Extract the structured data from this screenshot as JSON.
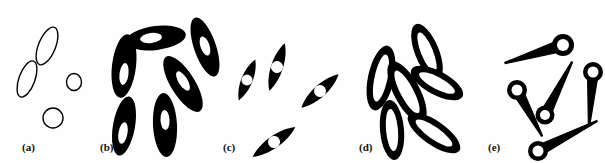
{
  "figure": {
    "title": "",
    "width": 605,
    "height": 163,
    "background_color": "#fefefe",
    "ink_color": "#000000",
    "hole_color": "#ffffff",
    "outline_stroke_width": 1.4
  },
  "panels": [
    {
      "id": "a",
      "label": "(a)",
      "label_x": 22,
      "label_y": 141,
      "style": "outline-ellipses",
      "description": "isolated thin-outlined ellipses, no fill"
    },
    {
      "id": "b",
      "label": "(b)",
      "label_x": 100,
      "label_y": 141,
      "style": "solid-ellipses-with-nucleus",
      "description": "solid black ellipses with small white inner ellipse, touching in chains"
    },
    {
      "id": "c",
      "label": "(c)",
      "label_x": 223,
      "label_y": 141,
      "style": "spindles-with-round-hole",
      "description": "elongated spindle blobs with white circular hole"
    },
    {
      "id": "d",
      "label": "(d)",
      "label_x": 359,
      "label_y": 141,
      "style": "thick-elliptical-rings",
      "description": "thick black elliptical annuli clustered and overlapping"
    },
    {
      "id": "e",
      "label": "(e)",
      "label_x": 488,
      "label_y": 141,
      "style": "tadpole-ring-head-with-tail",
      "description": "ring-headed tadpole shapes with tapering tails"
    }
  ],
  "shapes": {
    "a": [
      {
        "name": "outline-ellipse-1",
        "cx": 47,
        "cy": 46,
        "rx": 8.5,
        "ry": 20,
        "rot": 22
      },
      {
        "name": "outline-ellipse-2",
        "cx": 27,
        "cy": 79,
        "rx": 8,
        "ry": 19,
        "rot": 20
      },
      {
        "name": "outline-ellipse-3",
        "cx": 74,
        "cy": 82,
        "rx": 7.5,
        "ry": 8.5,
        "rot": 0
      },
      {
        "name": "outline-ellipse-4",
        "cx": 53,
        "cy": 118,
        "rx": 10,
        "ry": 10,
        "rot": 0
      }
    ],
    "b": [
      {
        "name": "solid-ellipse-1",
        "cx": 124,
        "cy": 66,
        "rx": 12,
        "ry": 32,
        "rot": 7,
        "hole": {
          "rx": 4.5,
          "ry": 11,
          "dx": 0,
          "dy": 8,
          "rot": 7
        }
      },
      {
        "name": "solid-ellipse-2",
        "cx": 156,
        "cy": 38,
        "rx": 30,
        "ry": 12,
        "rot": -7,
        "hole": {
          "rx": 11,
          "ry": 5,
          "dx": -5,
          "dy": 0,
          "rot": -7
        }
      },
      {
        "name": "solid-ellipse-3",
        "cx": 124,
        "cy": 126,
        "rx": 11,
        "ry": 30,
        "rot": 10,
        "hole": {
          "rx": 4.5,
          "ry": 11,
          "dx": -1,
          "dy": 7,
          "rot": 10
        }
      },
      {
        "name": "solid-ellipse-4",
        "cx": 165,
        "cy": 125,
        "rx": 12,
        "ry": 32,
        "rot": -3,
        "hole": {
          "rx": 4.5,
          "ry": 10,
          "dx": 0,
          "dy": -5,
          "rot": -3
        }
      },
      {
        "name": "solid-ellipse-5",
        "cx": 183,
        "cy": 84,
        "rx": 12,
        "ry": 32,
        "rot": -32,
        "hole": {
          "rx": 4.5,
          "ry": 11,
          "dx": 0,
          "dy": -3,
          "rot": -32
        }
      },
      {
        "name": "solid-ellipse-6",
        "cx": 205,
        "cy": 47,
        "rx": 11,
        "ry": 31,
        "rot": -19,
        "hole": {
          "rx": 4.5,
          "ry": 10,
          "dx": 0,
          "dy": -1,
          "rot": -19
        }
      }
    ],
    "c": [
      {
        "name": "spindle-1",
        "cx": 247,
        "cy": 80,
        "len": 44,
        "wid": 15,
        "rot": -68,
        "hole_r": 5.5
      },
      {
        "name": "spindle-2",
        "cx": 277,
        "cy": 67,
        "len": 50,
        "wid": 16,
        "rot": -72,
        "hole_r": 6
      },
      {
        "name": "spindle-3",
        "cx": 320,
        "cy": 91,
        "len": 50,
        "wid": 16,
        "rot": -42,
        "hole_r": 6
      },
      {
        "name": "spindle-4",
        "cx": 274,
        "cy": 142,
        "len": 52,
        "wid": 16,
        "rot": -35,
        "hole_r": 6
      }
    ],
    "d": [
      {
        "name": "ring-1",
        "cx": 381,
        "cy": 78,
        "rx": 13,
        "ry": 33,
        "rot": 12,
        "hole_rx": 6.5,
        "hole_ry": 24
      },
      {
        "name": "ring-2",
        "cx": 392,
        "cy": 130,
        "rx": 12,
        "ry": 30,
        "rot": -5,
        "hole_rx": 6,
        "hole_ry": 21
      },
      {
        "name": "ring-3",
        "cx": 407,
        "cy": 92,
        "rx": 13,
        "ry": 34,
        "rot": -28,
        "hole_rx": 6.5,
        "hole_ry": 24
      },
      {
        "name": "ring-4",
        "cx": 427,
        "cy": 52,
        "rx": 12,
        "ry": 30,
        "rot": -22,
        "hole_rx": 6,
        "hole_ry": 21
      },
      {
        "name": "ring-5",
        "cx": 437,
        "cy": 83,
        "rx": 12,
        "ry": 29,
        "rot": -62,
        "hole_rx": 6,
        "hole_ry": 20
      },
      {
        "name": "ring-6",
        "cx": 434,
        "cy": 133,
        "rx": 12,
        "ry": 31,
        "rot": -55,
        "hole_rx": 6,
        "hole_ry": 22
      }
    ],
    "e": [
      {
        "name": "tadpole-1",
        "hx": 563,
        "hy": 45,
        "hr": 11,
        "hole_r": 6,
        "tx": 505,
        "ty": 63,
        "tw": 5.5
      },
      {
        "name": "tadpole-2",
        "hx": 517,
        "hy": 90,
        "hr": 10,
        "hole_r": 5.5,
        "tx": 542,
        "ty": 136,
        "tw": 5
      },
      {
        "name": "tadpole-3",
        "hx": 545,
        "hy": 115,
        "hr": 9.5,
        "hole_r": 5,
        "tx": 572,
        "ty": 62,
        "tw": 5
      },
      {
        "name": "tadpole-4",
        "hx": 593,
        "hy": 72,
        "hr": 10,
        "hole_r": 5.5,
        "tx": 589,
        "ty": 126,
        "tw": 5
      },
      {
        "name": "tadpole-5",
        "hx": 538,
        "hy": 151,
        "hr": 10,
        "hole_r": 5.5,
        "tx": 597,
        "ty": 121,
        "tw": 5
      }
    ]
  }
}
